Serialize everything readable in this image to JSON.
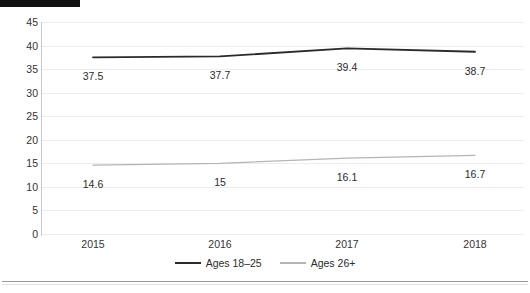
{
  "chart_data": {
    "type": "line",
    "title": "",
    "xlabel": "",
    "ylabel": "",
    "categories": [
      "2015",
      "2016",
      "2017",
      "2018"
    ],
    "series": [
      {
        "name": "Ages 18–25",
        "values": [
          37.5,
          37.7,
          39.4,
          38.7
        ],
        "labels": [
          "37.5",
          "37.7",
          "39.4",
          "38.7"
        ],
        "color": "#2b2b2b"
      },
      {
        "name": "Ages 26+",
        "values": [
          14.6,
          15,
          16.1,
          16.7
        ],
        "labels": [
          "14.6",
          "15",
          "16.1",
          "16.7"
        ],
        "color": "#b5b5b5"
      }
    ],
    "ylim": [
      0,
      45
    ],
    "yticks": [
      "0",
      "5",
      "10",
      "15",
      "20",
      "25",
      "30",
      "35",
      "40",
      "45"
    ],
    "ytick_values": [
      0,
      5,
      10,
      15,
      20,
      25,
      30,
      35,
      40,
      45
    ],
    "grid": true,
    "legend_position": "bottom",
    "gridline_color": "#ededed",
    "axis_color": "#c9c9c9",
    "background": "#ffffff"
  },
  "legend": {
    "items": [
      {
        "label": "Ages 18–25",
        "color": "#2b2b2b"
      },
      {
        "label": "Ages 26+",
        "color": "#b5b5b5"
      }
    ]
  },
  "artifacts": {
    "clipped_title": ""
  }
}
